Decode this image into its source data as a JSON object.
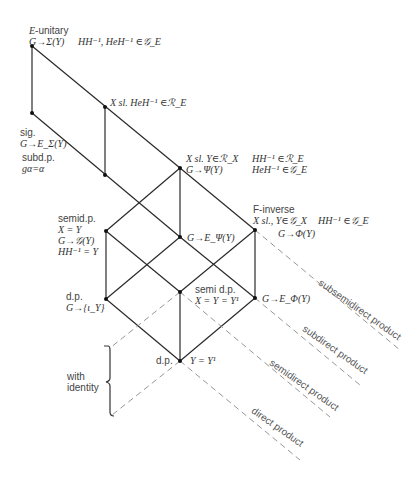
{
  "nodes": {
    "e_unitary": {
      "title": "E-unitary",
      "line1": "G→Σ(Y)",
      "cond": "HH⁻¹, HeH⁻¹ ∈𝒢_E"
    },
    "x_sl_top": {
      "line1": "X sl.  HeH⁻¹ ∈ℛ_E"
    },
    "sig": {
      "title": "sig.",
      "line1": "G→E_Σ(Y)"
    },
    "subdp": {
      "title": "subd.p.",
      "line1": "gα=α"
    },
    "x_sl_mid": {
      "line1": "X sl.  Y∈ℛ_X",
      "line2": "G→Ψ(Y)",
      "cond1": "HH⁻¹ ∈ℛ_E",
      "cond2": "HeH⁻¹ ∈𝒢_E"
    },
    "f_inverse": {
      "title": "F-inverse",
      "line1": "X sl., Y∈𝒢_X",
      "cond": "HH⁻¹ ∈𝒢_E",
      "line2": "G→Φ(Y)"
    },
    "semidp": {
      "title": "semid.p.",
      "line1": "X = Y",
      "line2": "G→𝒢(Y)",
      "line3": "HH⁻¹ = Y"
    },
    "g_e_psi": {
      "line1": "G→E_Ψ(Y)"
    },
    "dp_left": {
      "title": "d.p.",
      "line1": "G→{ι_Y}"
    },
    "semi_dp": {
      "title": "semi d.p.",
      "line1": "X = Y = Y¹"
    },
    "g_e_phi": {
      "line1": "G→E_Φ(Y)"
    },
    "dp_bottom": {
      "title": "d.p.",
      "line1": "Y = Y¹"
    }
  },
  "bracket_label": {
    "line1": "with",
    "line2": "identity"
  },
  "product_labels": {
    "subsemidirect": "subsemidirect product",
    "subdirect": "subdirect product",
    "semidirect": "semidirect product",
    "direct": "direct product"
  }
}
